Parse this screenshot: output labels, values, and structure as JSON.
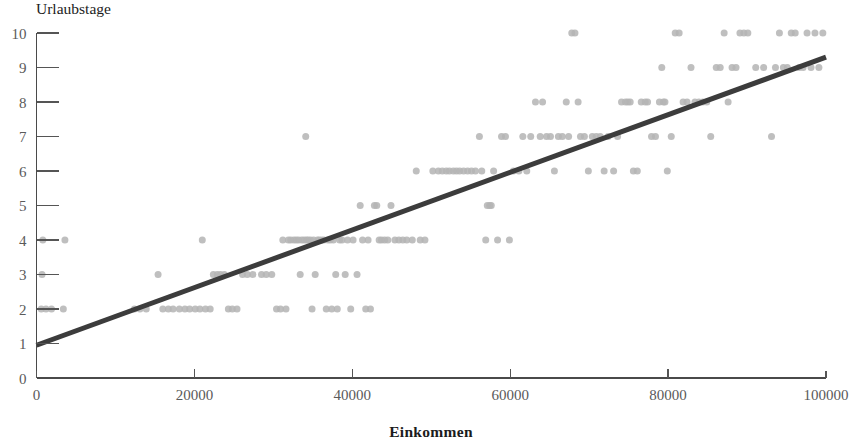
{
  "chart_data": {
    "type": "scatter",
    "title": "",
    "xlabel": "Einkommen",
    "ylabel": "Urlaubstage",
    "xlim": [
      0,
      100000
    ],
    "ylim": [
      0,
      10
    ],
    "grid": false,
    "legend": "none",
    "x_ticks": [
      0,
      20000,
      40000,
      60000,
      80000,
      100000
    ],
    "x_tick_labels": [
      "0",
      "20000",
      "40000",
      "60000",
      "80000",
      "100000"
    ],
    "y_ticks": [
      0,
      1,
      2,
      3,
      4,
      5,
      6,
      7,
      8,
      9,
      10
    ],
    "y_tick_labels": [
      "0",
      "1",
      "2",
      "3",
      "4",
      "5",
      "6",
      "7",
      "8",
      "9",
      "10"
    ],
    "marker": {
      "shape": "circle",
      "color": "#b4b4b4",
      "opacity": 0.85,
      "size_px": 7
    },
    "trendline": {
      "type": "linear",
      "color": "#3c3c3c",
      "width_px": 5,
      "x_start": 0,
      "y_start": 0.95,
      "x_end": 100000,
      "y_end": 9.3,
      "slope_per_unit": 8.35e-05,
      "intercept": 0.95
    },
    "series": [
      {
        "name": "Beobachtungen",
        "points": [
          [
            600,
            2
          ],
          [
            1200,
            2
          ],
          [
            1900,
            2
          ],
          [
            3400,
            2
          ],
          [
            700,
            3
          ],
          [
            800,
            4
          ],
          [
            3600,
            4
          ],
          [
            12400,
            2
          ],
          [
            13100,
            2
          ],
          [
            13900,
            2
          ],
          [
            15400,
            3
          ],
          [
            16000,
            2
          ],
          [
            16700,
            2
          ],
          [
            17300,
            2
          ],
          [
            18100,
            2
          ],
          [
            18800,
            2
          ],
          [
            19400,
            2
          ],
          [
            20100,
            2
          ],
          [
            20700,
            2
          ],
          [
            21000,
            4
          ],
          [
            21400,
            2
          ],
          [
            22000,
            2
          ],
          [
            22400,
            3
          ],
          [
            22900,
            3
          ],
          [
            23300,
            3
          ],
          [
            23800,
            3
          ],
          [
            24300,
            2
          ],
          [
            24800,
            2
          ],
          [
            25400,
            2
          ],
          [
            26100,
            3
          ],
          [
            26700,
            3
          ],
          [
            27400,
            3
          ],
          [
            28500,
            3
          ],
          [
            29100,
            3
          ],
          [
            29800,
            3
          ],
          [
            30400,
            2
          ],
          [
            30900,
            2
          ],
          [
            31200,
            4
          ],
          [
            31600,
            2
          ],
          [
            31900,
            4
          ],
          [
            32200,
            4
          ],
          [
            32600,
            4
          ],
          [
            32900,
            4
          ],
          [
            33200,
            4
          ],
          [
            33400,
            3
          ],
          [
            33600,
            4
          ],
          [
            33900,
            4
          ],
          [
            34100,
            7
          ],
          [
            34200,
            4
          ],
          [
            34400,
            4
          ],
          [
            34700,
            4
          ],
          [
            34900,
            2
          ],
          [
            35100,
            4
          ],
          [
            35300,
            3
          ],
          [
            35600,
            4
          ],
          [
            35800,
            4
          ],
          [
            36100,
            4
          ],
          [
            36400,
            4
          ],
          [
            36700,
            2
          ],
          [
            36900,
            4
          ],
          [
            37200,
            4
          ],
          [
            37400,
            2
          ],
          [
            37600,
            4
          ],
          [
            37900,
            3
          ],
          [
            38100,
            2
          ],
          [
            38400,
            4
          ],
          [
            38700,
            4
          ],
          [
            39100,
            3
          ],
          [
            39400,
            4
          ],
          [
            39800,
            2
          ],
          [
            40100,
            4
          ],
          [
            40600,
            3
          ],
          [
            41000,
            5
          ],
          [
            41300,
            4
          ],
          [
            41700,
            2
          ],
          [
            42000,
            4
          ],
          [
            42300,
            2
          ],
          [
            42800,
            5
          ],
          [
            43100,
            5
          ],
          [
            43400,
            4
          ],
          [
            43700,
            4
          ],
          [
            44100,
            4
          ],
          [
            44500,
            4
          ],
          [
            44900,
            5
          ],
          [
            45400,
            4
          ],
          [
            45900,
            4
          ],
          [
            46400,
            4
          ],
          [
            46900,
            4
          ],
          [
            47600,
            4
          ],
          [
            48100,
            6
          ],
          [
            48600,
            4
          ],
          [
            49200,
            4
          ],
          [
            50200,
            6
          ],
          [
            50900,
            6
          ],
          [
            51400,
            6
          ],
          [
            51900,
            6
          ],
          [
            52300,
            6
          ],
          [
            52800,
            6
          ],
          [
            53200,
            6
          ],
          [
            53600,
            6
          ],
          [
            54100,
            6
          ],
          [
            54600,
            6
          ],
          [
            55100,
            6
          ],
          [
            55600,
            6
          ],
          [
            56100,
            7
          ],
          [
            56400,
            6
          ],
          [
            56900,
            4
          ],
          [
            57100,
            5
          ],
          [
            57400,
            5
          ],
          [
            57600,
            5
          ],
          [
            57900,
            6
          ],
          [
            58400,
            4
          ],
          [
            58900,
            7
          ],
          [
            59400,
            7
          ],
          [
            59900,
            4
          ],
          [
            60400,
            6
          ],
          [
            61100,
            6
          ],
          [
            61600,
            7
          ],
          [
            62100,
            6
          ],
          [
            62600,
            7
          ],
          [
            63200,
            8
          ],
          [
            63800,
            7
          ],
          [
            64100,
            8
          ],
          [
            64600,
            7
          ],
          [
            65100,
            7
          ],
          [
            65600,
            6
          ],
          [
            66100,
            7
          ],
          [
            66600,
            7
          ],
          [
            67100,
            8
          ],
          [
            67400,
            7
          ],
          [
            67800,
            10
          ],
          [
            68200,
            10
          ],
          [
            68600,
            8
          ],
          [
            68900,
            7
          ],
          [
            69400,
            7
          ],
          [
            69900,
            6
          ],
          [
            70400,
            7
          ],
          [
            70900,
            7
          ],
          [
            71400,
            7
          ],
          [
            71900,
            6
          ],
          [
            72400,
            7
          ],
          [
            73100,
            6
          ],
          [
            73600,
            7
          ],
          [
            74100,
            8
          ],
          [
            74600,
            8
          ],
          [
            74900,
            8
          ],
          [
            75200,
            8
          ],
          [
            75600,
            6
          ],
          [
            76100,
            6
          ],
          [
            76600,
            8
          ],
          [
            77100,
            8
          ],
          [
            77400,
            8
          ],
          [
            77900,
            7
          ],
          [
            78400,
            7
          ],
          [
            78900,
            8
          ],
          [
            79200,
            9
          ],
          [
            79400,
            8
          ],
          [
            79600,
            8
          ],
          [
            79900,
            6
          ],
          [
            80400,
            7
          ],
          [
            80900,
            10
          ],
          [
            81400,
            10
          ],
          [
            81900,
            8
          ],
          [
            82400,
            8
          ],
          [
            82900,
            9
          ],
          [
            83400,
            8
          ],
          [
            83900,
            8
          ],
          [
            84400,
            8
          ],
          [
            84900,
            8
          ],
          [
            85400,
            7
          ],
          [
            86100,
            9
          ],
          [
            86600,
            9
          ],
          [
            87100,
            10
          ],
          [
            87600,
            8
          ],
          [
            88100,
            9
          ],
          [
            88600,
            9
          ],
          [
            89100,
            10
          ],
          [
            89600,
            10
          ],
          [
            90100,
            10
          ],
          [
            91100,
            9
          ],
          [
            92100,
            9
          ],
          [
            93100,
            7
          ],
          [
            93600,
            9
          ],
          [
            94100,
            10
          ],
          [
            94600,
            9
          ],
          [
            95100,
            9
          ],
          [
            95600,
            10
          ],
          [
            96100,
            10
          ],
          [
            96600,
            9
          ],
          [
            97100,
            9
          ],
          [
            97600,
            10
          ],
          [
            98100,
            9
          ],
          [
            98600,
            10
          ],
          [
            99100,
            9
          ],
          [
            99600,
            10
          ]
        ]
      }
    ]
  },
  "figure": {
    "y_axis_title": "Urlaubstage",
    "x_axis_title": "Einkommen",
    "accent_color": "#3c3c3c",
    "point_color": "#b4b4b4",
    "axis_color": "#4a4a4a",
    "tick_text_color": "#5a5a5a"
  }
}
